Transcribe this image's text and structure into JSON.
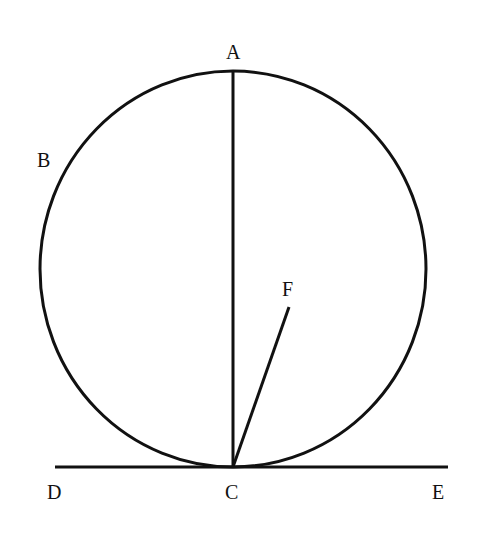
{
  "diagram": {
    "type": "geometry",
    "colors": {
      "stroke": "#111111",
      "background": "#ffffff"
    },
    "labels": {
      "A": "A",
      "B": "B",
      "C": "C",
      "D": "D",
      "E": "E",
      "F": "F"
    },
    "elements": [
      {
        "kind": "circle",
        "passes_through": [
          "A",
          "B",
          "C"
        ]
      },
      {
        "kind": "segment",
        "from": "A",
        "to": "C",
        "note": "diameter"
      },
      {
        "kind": "segment",
        "from": "C",
        "to": "F"
      },
      {
        "kind": "line",
        "from": "D",
        "to": "E",
        "note": "tangent at C"
      }
    ]
  }
}
